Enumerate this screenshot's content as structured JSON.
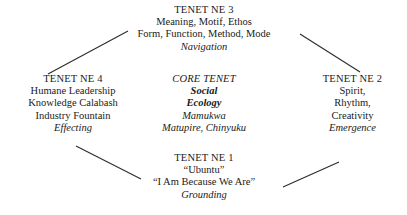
{
  "diagram": {
    "background_color": "#ffffff",
    "text_color": "#1a1a1a",
    "edge_color": "#2b2b2b",
    "nodes": {
      "top": {
        "heading": "TENET NE 3",
        "line1": "Meaning, Motif, Ethos",
        "line2": "Form, Function, Method, Mode",
        "italic": "Navigation"
      },
      "left": {
        "heading": "TENET NE 4",
        "line1": "Humane Leadership",
        "line2": "Knowledge Calabash",
        "line3": "Industry Fountain",
        "italic": "Effecting"
      },
      "core": {
        "label": "CORE TENET",
        "name1": "Social",
        "name2": "Ecology",
        "author1": "Mamukwa",
        "author2": "Matupire, Chinyuku"
      },
      "right": {
        "heading": "TENET NE 2",
        "line1": "Spirit,",
        "line2": "Rhythm,",
        "line3": "Creativity",
        "italic": "Emergence"
      },
      "bottom": {
        "heading": "TENET NE 1",
        "line1": "“Ubuntu”",
        "line2": "“I Am Because We Are”",
        "italic": "Grounding"
      }
    },
    "edges": [
      {
        "name": "edge-left-to-top",
        "x1": 48,
        "y1": 74,
        "x2": 128,
        "y2": 31
      },
      {
        "name": "edge-top-to-right",
        "x1": 300,
        "y1": 34,
        "x2": 360,
        "y2": 72
      },
      {
        "name": "edge-left-to-bottom",
        "x1": 76,
        "y1": 146,
        "x2": 141,
        "y2": 179
      },
      {
        "name": "edge-bottom-to-right",
        "x1": 283,
        "y1": 187,
        "x2": 339,
        "y2": 162
      }
    ]
  }
}
